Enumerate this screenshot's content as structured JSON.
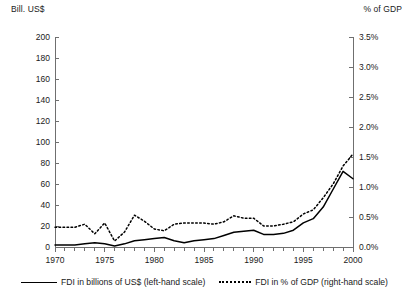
{
  "chart_data": {
    "type": "line",
    "title": "",
    "xlabel": "",
    "left_axis_caption": "Bill. US$",
    "right_axis_caption": "% of GDP",
    "grid": false,
    "legend_position": "bottom",
    "x": [
      1970,
      1971,
      1972,
      1973,
      1974,
      1975,
      1976,
      1977,
      1978,
      1979,
      1980,
      1981,
      1982,
      1983,
      1984,
      1985,
      1986,
      1987,
      1988,
      1989,
      1990,
      1991,
      1992,
      1993,
      1994,
      1995,
      1996,
      1997,
      1998,
      1999,
      2000
    ],
    "x_tick_labels": [
      "1970",
      "1975",
      "1980",
      "1985",
      "1990",
      "1995",
      "2000"
    ],
    "x_tick_values": [
      1970,
      1975,
      1980,
      1985,
      1990,
      1995,
      2000
    ],
    "xlim": [
      1970,
      2000
    ],
    "left_axis": {
      "label": "Bill. US$",
      "ylim": [
        0,
        200
      ],
      "ticks": [
        0,
        20,
        40,
        60,
        80,
        100,
        120,
        140,
        160,
        180,
        200
      ],
      "tick_labels": [
        "0",
        "20",
        "40",
        "60",
        "80",
        "100",
        "120",
        "140",
        "160",
        "180",
        "200"
      ]
    },
    "right_axis": {
      "label": "% of GDP",
      "ylim": [
        0,
        3.5
      ],
      "ticks": [
        0,
        0.5,
        1.0,
        1.5,
        2.0,
        2.5,
        3.0,
        3.5
      ],
      "tick_labels": [
        "0.0%",
        "0.5%",
        "1.0%",
        "1.5%",
        "2.0%",
        "2.5%",
        "3.0%",
        "3.5%"
      ]
    },
    "series": [
      {
        "name": "FDI in billions of US$ (left-hand scale)",
        "axis": "left",
        "style": "solid",
        "color": "#000000",
        "values": [
          2,
          2,
          2,
          3,
          4,
          3,
          1,
          3,
          6,
          7,
          8,
          9,
          6,
          4,
          6,
          7,
          8,
          11,
          14,
          15,
          16,
          12,
          12,
          13,
          16,
          23,
          27,
          38,
          55,
          72,
          65
        ]
      },
      {
        "name": "FDI  in % of GDP (right-hand scale)",
        "axis": "right",
        "style": "dotted",
        "color": "#000000",
        "values": [
          0.33,
          0.33,
          0.33,
          0.38,
          0.22,
          0.4,
          0.1,
          0.25,
          0.53,
          0.43,
          0.3,
          0.27,
          0.38,
          0.4,
          0.4,
          0.4,
          0.38,
          0.42,
          0.52,
          0.48,
          0.48,
          0.35,
          0.35,
          0.38,
          0.42,
          0.55,
          0.62,
          0.82,
          1.05,
          1.35,
          1.55
        ]
      }
    ]
  },
  "legend": {
    "items": [
      {
        "label": "FDI in billions of US$ (left-hand scale)",
        "style": "solid"
      },
      {
        "label": "FDI  in % of GDP (right-hand scale)",
        "style": "dotted"
      }
    ]
  }
}
